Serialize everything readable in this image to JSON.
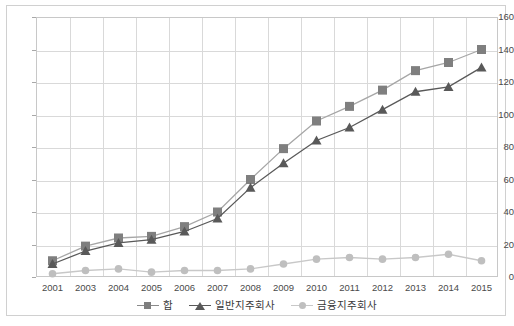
{
  "chart_data": {
    "type": "line",
    "title": "",
    "subtitle": "",
    "xlabel": "",
    "ylabel": "",
    "categories": [
      "2001",
      "2003",
      "2004",
      "2005",
      "2006",
      "2007",
      "2008",
      "2009",
      "2010",
      "2011",
      "2012",
      "2013",
      "2014",
      "2015"
    ],
    "ylim": [
      0,
      160
    ],
    "ytick_values": [
      0,
      20,
      40,
      60,
      80,
      100,
      120,
      140,
      160
    ],
    "ytick_labels": [
      "0",
      "20",
      "40",
      "60",
      "80",
      "100",
      "120",
      "140",
      "160"
    ],
    "grid": true,
    "legend_position": "bottom",
    "series": [
      {
        "name": "합",
        "marker": "square",
        "color": "#7f7f7f",
        "line_color": "#a6a6a6",
        "values": [
          10,
          19,
          24,
          25,
          31,
          40,
          60,
          79,
          96,
          105,
          115,
          127,
          132,
          140
        ]
      },
      {
        "name": "일반지주회사",
        "marker": "triangle",
        "color": "#595959",
        "line_color": "#595959",
        "values": [
          8,
          16,
          21,
          23,
          28,
          36,
          55,
          70,
          84,
          92,
          103,
          114,
          117,
          129
        ]
      },
      {
        "name": "금융지주회사",
        "marker": "circle",
        "color": "#bfbfbf",
        "line_color": "#c8c8c8",
        "values": [
          2,
          4,
          5,
          3,
          4,
          4,
          5,
          8,
          11,
          12,
          11,
          12,
          14,
          10
        ]
      }
    ]
  },
  "axes": {
    "y_max_label": "160",
    "y_min_label": "0"
  },
  "legend": {
    "items": [
      {
        "label": "합",
        "marker": "square-marker"
      },
      {
        "label": "일반지주회사",
        "marker": "triangle-marker"
      },
      {
        "label": "금융지주회사",
        "marker": "circle-marker"
      }
    ]
  }
}
